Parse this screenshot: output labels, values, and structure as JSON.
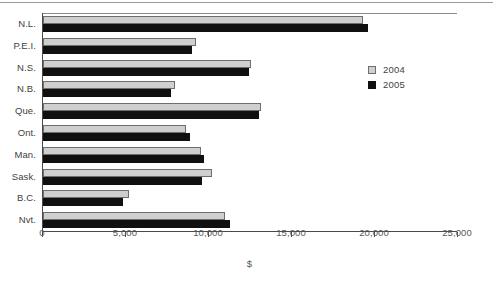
{
  "chart_data": {
    "type": "bar",
    "orientation": "horizontal",
    "title": "",
    "xlabel": "$",
    "ylabel": "",
    "xlim": [
      0,
      25000
    ],
    "grid": false,
    "legend_position": "right",
    "xticks": [
      "0",
      "5,000",
      "10,000",
      "15,000",
      "20,000",
      "25,000"
    ],
    "xtick_values": [
      0,
      5000,
      10000,
      15000,
      20000,
      25000
    ],
    "categories": [
      "N.L.",
      "P.E.I.",
      "N.S.",
      "N.B.",
      "Que.",
      "Ont.",
      "Man.",
      "Sask.",
      "B.C.",
      "Nvt."
    ],
    "series": [
      {
        "name": "2004",
        "color": "#cfcfcf",
        "values": [
          19300,
          9200,
          12500,
          7950,
          13150,
          8600,
          9500,
          10200,
          5200,
          10950
        ]
      },
      {
        "name": "2005",
        "color": "#101010",
        "values": [
          19550,
          8950,
          12400,
          7700,
          13000,
          8850,
          9700,
          9600,
          4800,
          11250
        ]
      }
    ]
  },
  "legend": {
    "items": [
      {
        "label": "2004",
        "swatch": "light-gray-square"
      },
      {
        "label": "2005",
        "swatch": "black-square"
      }
    ]
  }
}
